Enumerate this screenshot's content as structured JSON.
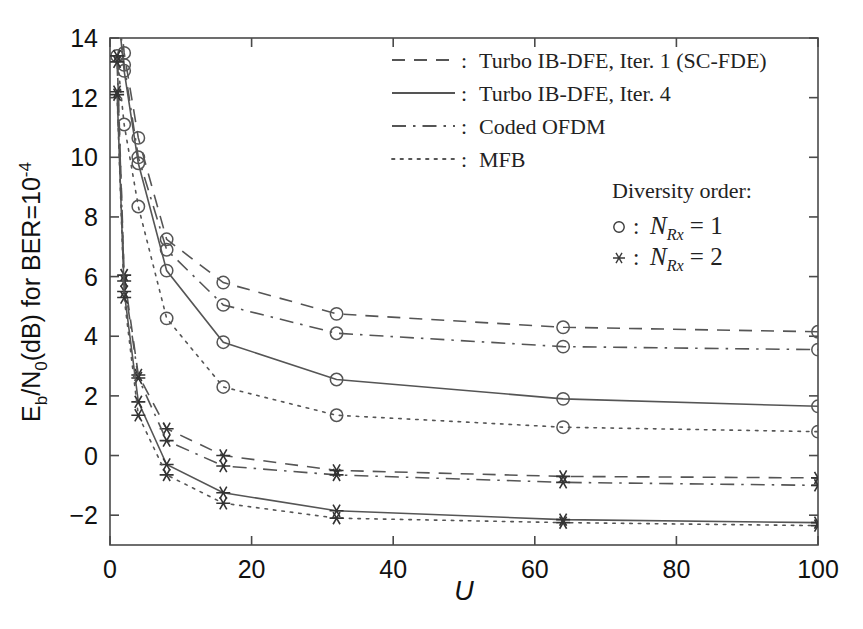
{
  "chart_data": {
    "type": "line",
    "title": "",
    "xlabel": "U",
    "ylabel": "E_b/N_0(dB) for BER=10^-4",
    "xlim": [
      0,
      100
    ],
    "ylim": [
      -3,
      14
    ],
    "xticks": [
      0,
      20,
      40,
      60,
      80,
      100
    ],
    "yticks": [
      -2,
      0,
      2,
      4,
      6,
      8,
      10,
      12,
      14
    ],
    "grid": false,
    "legend_position": "top-right",
    "legend": [
      {
        "label": "Turbo IB-DFE, Iter. 1 (SC-FDE)",
        "style": "dashed"
      },
      {
        "label": "Turbo IB-DFE, Iter. 4",
        "style": "solid"
      },
      {
        "label": "Coded OFDM",
        "style": "dashdot"
      },
      {
        "label": "MFB",
        "style": "dotted"
      }
    ],
    "marker_legend_title": "Diversity order:",
    "marker_legend": [
      {
        "marker": "circle",
        "label": "N_Rx = 1"
      },
      {
        "marker": "asterisk",
        "label": "N_Rx = 2"
      }
    ],
    "series": [
      {
        "name": "Turbo IB-DFE, Iter. 1 (SC-FDE), NRx=1",
        "style": "dashed",
        "marker": "circle",
        "x": [
          1,
          2,
          4,
          8,
          16,
          32,
          64,
          100
        ],
        "y": [
          16.0,
          13.5,
          10.65,
          7.25,
          5.8,
          4.75,
          4.3,
          4.15
        ]
      },
      {
        "name": "Coded OFDM, NRx=1",
        "style": "dashdot",
        "marker": "circle",
        "x": [
          1,
          2,
          4,
          8,
          16,
          32,
          64,
          100
        ],
        "y": [
          15.4,
          13.1,
          10.0,
          6.9,
          5.05,
          4.1,
          3.65,
          3.55
        ]
      },
      {
        "name": "Turbo IB-DFE, Iter. 4, NRx=1",
        "style": "solid",
        "marker": "circle",
        "x": [
          1,
          2,
          4,
          8,
          16,
          32,
          64,
          100
        ],
        "y": [
          15.2,
          12.9,
          9.8,
          6.2,
          3.8,
          2.55,
          1.9,
          1.65
        ]
      },
      {
        "name": "MFB, NRx=1",
        "style": "dotted",
        "marker": "circle",
        "x": [
          1,
          2,
          4,
          8,
          16,
          32,
          64,
          100
        ],
        "y": [
          13.4,
          11.1,
          8.35,
          4.6,
          2.3,
          1.35,
          0.95,
          0.8
        ]
      },
      {
        "name": "Turbo IB-DFE, Iter. 1 (SC-FDE), NRx=2",
        "style": "dashed",
        "marker": "asterisk",
        "x": [
          1,
          2,
          4,
          8,
          16,
          32,
          64,
          100
        ],
        "y": [
          13.4,
          6.05,
          2.7,
          0.9,
          0.0,
          -0.5,
          -0.7,
          -0.75
        ]
      },
      {
        "name": "Coded OFDM, NRx=2",
        "style": "dashdot",
        "marker": "asterisk",
        "x": [
          1,
          2,
          4,
          8,
          16,
          32,
          64,
          100
        ],
        "y": [
          13.2,
          5.85,
          2.6,
          0.5,
          -0.35,
          -0.65,
          -0.9,
          -1.0
        ]
      },
      {
        "name": "Turbo IB-DFE, Iter. 4, NRx=2",
        "style": "solid",
        "marker": "asterisk",
        "x": [
          1,
          2,
          4,
          8,
          16,
          32,
          64,
          100
        ],
        "y": [
          12.2,
          5.5,
          1.8,
          -0.3,
          -1.25,
          -1.85,
          -2.15,
          -2.25
        ]
      },
      {
        "name": "MFB, NRx=2",
        "style": "dotted",
        "marker": "asterisk",
        "x": [
          1,
          2,
          4,
          8,
          16,
          32,
          64,
          100
        ],
        "y": [
          12.1,
          5.3,
          1.35,
          -0.65,
          -1.6,
          -2.1,
          -2.25,
          -2.35
        ]
      }
    ]
  },
  "labels": {
    "ylabel_parts": {
      "e": "E",
      "b": "b",
      "slash": "/N",
      "zero": "0",
      "db": "(dB) for BER=10",
      "exp": "-4"
    },
    "xlabel": "U",
    "legend_title": "Diversity order:",
    "nrx1": "N",
    "nrx1_sub": "Rx",
    "nrx1_eq": " = 1",
    "nrx2_eq": " = 2",
    "colon": ":"
  }
}
